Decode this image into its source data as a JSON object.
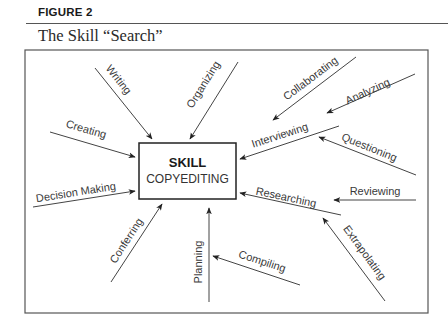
{
  "figure": {
    "label": "FIGURE 2",
    "title": "The Skill “Search”"
  },
  "center": {
    "title": "SKILL",
    "subtitle": "COPYEDITING"
  },
  "colors": {
    "line": "#444444",
    "text": "#3a3a3a"
  },
  "activities": [
    {
      "label": "Writing",
      "target": "skill"
    },
    {
      "label": "Organizing",
      "target": "skill"
    },
    {
      "label": "Creating",
      "target": "skill"
    },
    {
      "label": "Decision Making",
      "target": "skill"
    },
    {
      "label": "Conferring",
      "target": "skill"
    },
    {
      "label": "Planning",
      "target": "skill"
    },
    {
      "label": "Compiling",
      "target": "Planning"
    },
    {
      "label": "Collaborating",
      "target": "Interviewing"
    },
    {
      "label": "Analyzing",
      "target": "Interviewing"
    },
    {
      "label": "Interviewing",
      "target": "skill"
    },
    {
      "label": "Questioning",
      "target": "Interviewing"
    },
    {
      "label": "Researching",
      "target": "skill"
    },
    {
      "label": "Reviewing",
      "target": "Researching"
    },
    {
      "label": "Extrapolating",
      "target": "Researching"
    }
  ]
}
